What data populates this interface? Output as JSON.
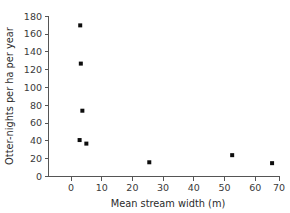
{
  "chart_data": {
    "type": "scatter",
    "title": "",
    "xlabel": "Mean stream width (m)",
    "ylabel": "Otter-nights per ha per year",
    "xlim": [
      -3,
      72
    ],
    "ylim": [
      0,
      182
    ],
    "xticks": [
      0,
      10,
      20,
      30,
      40,
      50,
      60,
      70
    ],
    "yticks": [
      0,
      20,
      40,
      60,
      80,
      100,
      120,
      140,
      160,
      180
    ],
    "xtick_labels": [
      "0",
      "10",
      "20",
      "30",
      "40",
      "50",
      "60",
      "70"
    ],
    "ytick_labels": [
      "0",
      "20",
      "40",
      "60",
      "80",
      "100",
      "120",
      "140",
      "160",
      "180"
    ],
    "grid": false,
    "legend": false,
    "marker": "filled-square",
    "marker_color": "#0d0d0d",
    "points": [
      {
        "x": 3.0,
        "y": 170
      },
      {
        "x": 3.2,
        "y": 127
      },
      {
        "x": 3.7,
        "y": 74
      },
      {
        "x": 2.8,
        "y": 41
      },
      {
        "x": 5.0,
        "y": 37
      },
      {
        "x": 25.5,
        "y": 16
      },
      {
        "x": 52.5,
        "y": 24
      },
      {
        "x": 65.5,
        "y": 15
      }
    ]
  },
  "figure": {
    "axis_color": "#555555",
    "text_color": "#2b2b2b",
    "background": "#ffffff"
  }
}
